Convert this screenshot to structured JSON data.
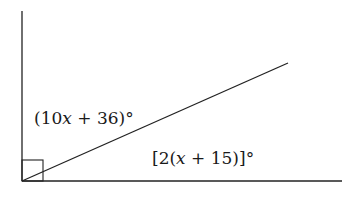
{
  "diagram": {
    "type": "geometry-angle-figure",
    "right_angle_marker": true,
    "colors": {
      "line": "#222222",
      "background": "#ffffff",
      "text": "#1a1a1a"
    },
    "lines": {
      "vertical": {
        "x1": 22,
        "y1": 11,
        "x2": 22,
        "y2": 181
      },
      "horizontal": {
        "x1": 22,
        "y1": 181,
        "x2": 342,
        "y2": 181
      },
      "ray": {
        "x1": 22,
        "y1": 181,
        "x2": 288,
        "y2": 63
      }
    },
    "right_angle_box": {
      "x": 22,
      "y": 160,
      "size": 21
    },
    "labels": {
      "upper_angle": {
        "prefix": "(10",
        "var": "x",
        "suffix": " + 36)°",
        "full": "(10x + 36)°"
      },
      "lower_angle": {
        "prefix": "[2(",
        "var": "x",
        "suffix": " + 15)]°",
        "full": "[2(x + 15)]°"
      }
    }
  }
}
